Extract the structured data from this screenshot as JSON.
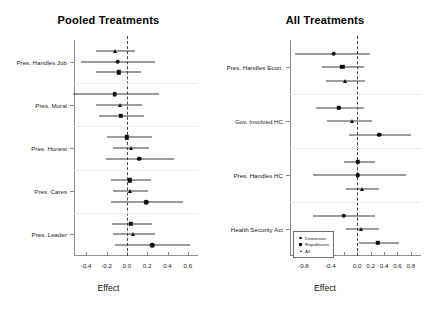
{
  "figure": {
    "background": "#ffffff",
    "marker_color": "#111111",
    "line_color": "#3a3a3a"
  },
  "legend": {
    "position": "bottom-left-of-right-panel",
    "entries": [
      {
        "label": "Democrats",
        "marker": "circle"
      },
      {
        "label": "Republicans",
        "marker": "square"
      },
      {
        "label": "All",
        "marker": "triangle"
      }
    ]
  },
  "chart_data": [
    {
      "type": "scatter",
      "subtype": "forest-plot",
      "title": "Pooled Treatments",
      "xlabel": "Effect",
      "ylabel": "",
      "xlim": [
        -0.52,
        0.7
      ],
      "xticks": [
        -0.4,
        -0.2,
        0.0,
        0.2,
        0.4,
        0.6
      ],
      "xticklabels": [
        "-0.4",
        "-0.2",
        "0.0",
        "0.2",
        "0.4",
        "0.6"
      ],
      "reference_line": 0.0,
      "grid": false,
      "categories": [
        "Pres. Handles Job",
        "Pres. Moral",
        "Pres. Honest",
        "Pres. Cares",
        "Pres. Leader"
      ],
      "groups": [
        {
          "category": "Pres. Handles Job",
          "points": [
            {
              "series": "All",
              "marker": "triangle",
              "estimate": -0.12,
              "low": -0.3,
              "high": 0.08
            },
            {
              "series": "Democrats",
              "marker": "circle",
              "estimate": -0.09,
              "low": -0.45,
              "high": 0.28
            },
            {
              "series": "Republicans",
              "marker": "square",
              "estimate": -0.08,
              "low": -0.3,
              "high": 0.14
            }
          ]
        },
        {
          "category": "Pres. Moral",
          "points": [
            {
              "series": "Democrats",
              "marker": "circle",
              "estimate": -0.12,
              "low": -0.53,
              "high": 0.32
            },
            {
              "series": "All",
              "marker": "triangle",
              "estimate": -0.07,
              "low": -0.3,
              "high": 0.15
            },
            {
              "series": "Republicans",
              "marker": "square",
              "estimate": -0.06,
              "low": -0.27,
              "high": 0.17
            }
          ]
        },
        {
          "category": "Pres. Honest",
          "points": [
            {
              "series": "Republicans",
              "marker": "square",
              "estimate": 0.0,
              "low": -0.2,
              "high": 0.25
            },
            {
              "series": "All",
              "marker": "triangle",
              "estimate": 0.04,
              "low": -0.14,
              "high": 0.22
            },
            {
              "series": "Democrats",
              "marker": "circle",
              "estimate": 0.12,
              "low": -0.21,
              "high": 0.46
            }
          ]
        },
        {
          "category": "Pres. Cares",
          "points": [
            {
              "series": "Republicans",
              "marker": "square",
              "estimate": 0.03,
              "low": -0.16,
              "high": 0.24
            },
            {
              "series": "All",
              "marker": "triangle",
              "estimate": 0.03,
              "low": -0.14,
              "high": 0.21
            },
            {
              "series": "Democrats",
              "marker": "circle",
              "estimate": 0.19,
              "low": -0.16,
              "high": 0.55
            }
          ]
        },
        {
          "category": "Pres. Leader",
          "points": [
            {
              "series": "Republicans",
              "marker": "square",
              "estimate": 0.04,
              "low": -0.15,
              "high": 0.25
            },
            {
              "series": "All",
              "marker": "triangle",
              "estimate": 0.06,
              "low": -0.14,
              "high": 0.28
            },
            {
              "series": "Democrats",
              "marker": "circle",
              "estimate": 0.25,
              "low": -0.12,
              "high": 0.62
            }
          ]
        }
      ]
    },
    {
      "type": "scatter",
      "subtype": "forest-plot",
      "title": "All Treatments",
      "xlabel": "Effect",
      "ylabel": "",
      "xlim": [
        -1.0,
        0.95
      ],
      "xticks": [
        -0.8,
        -0.6,
        -0.4,
        -0.2,
        0.0,
        0.2,
        0.4,
        0.6,
        0.8
      ],
      "xticklabels": [
        "-0.8",
        "",
        "-0.4",
        "",
        "0.0",
        "0.2",
        "0.4",
        "0.6",
        "0.8"
      ],
      "reference_line": 0.0,
      "grid": false,
      "categories": [
        "Pres. Handles Econ.",
        "Gov. Involved HC",
        "Pres. Handles HC",
        "Health Security Act"
      ],
      "groups": [
        {
          "category": "Pres. Handles Econ.",
          "points": [
            {
              "series": "Democrats",
              "marker": "circle",
              "estimate": -0.35,
              "low": -0.93,
              "high": 0.19
            },
            {
              "series": "Republicans",
              "marker": "square",
              "estimate": -0.22,
              "low": -0.52,
              "high": 0.1
            },
            {
              "series": "All",
              "marker": "triangle",
              "estimate": -0.18,
              "low": -0.47,
              "high": 0.11
            }
          ]
        },
        {
          "category": "Gov. Involved HC",
          "points": [
            {
              "series": "Republicans",
              "marker": "square",
              "estimate": -0.27,
              "low": -0.62,
              "high": 0.1
            },
            {
              "series": "All",
              "marker": "triangle",
              "estimate": -0.07,
              "low": -0.45,
              "high": 0.22
            },
            {
              "series": "Democrats",
              "marker": "circle",
              "estimate": 0.33,
              "low": -0.12,
              "high": 0.8
            }
          ]
        },
        {
          "category": "Pres. Handles HC",
          "points": [
            {
              "series": "Republicans",
              "marker": "square",
              "estimate": 0.01,
              "low": -0.19,
              "high": 0.27
            },
            {
              "series": "Democrats",
              "marker": "circle",
              "estimate": 0.01,
              "low": -0.66,
              "high": 0.72
            },
            {
              "series": "All",
              "marker": "triangle",
              "estimate": 0.07,
              "low": -0.17,
              "high": 0.32
            }
          ]
        },
        {
          "category": "Health Security Act",
          "points": [
            {
              "series": "Democrats",
              "marker": "circle",
              "estimate": -0.2,
              "low": -0.66,
              "high": 0.27
            },
            {
              "series": "All",
              "marker": "triangle",
              "estimate": 0.06,
              "low": -0.17,
              "high": 0.32
            },
            {
              "series": "Republicans",
              "marker": "square",
              "estimate": 0.31,
              "low": 0.03,
              "high": 0.62
            }
          ]
        }
      ]
    }
  ]
}
